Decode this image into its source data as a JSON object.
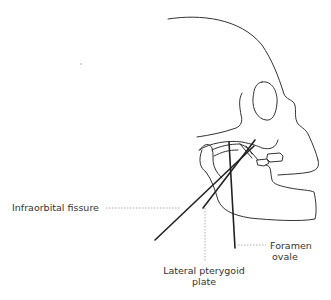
{
  "figure": {
    "type": "anatomical line drawing",
    "line_color": "#222222",
    "leader_color": "#888888"
  },
  "labels": {
    "infraorbital": "Infraorbital fissure",
    "lateral_line1": "Lateral pterygoid",
    "lateral_line2": "plate",
    "foramen_line1": "Foramen",
    "foramen_line2": "ovale"
  }
}
